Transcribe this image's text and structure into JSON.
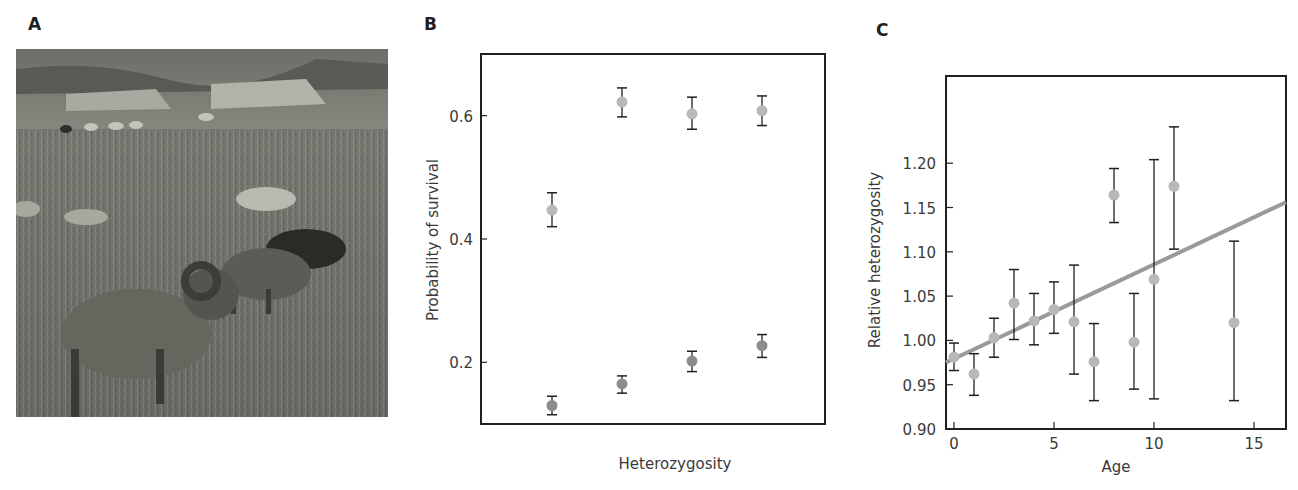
{
  "panels": {
    "a": {
      "label": "A",
      "image_description": "Grayscale photo of Soay sheep grazing on a grassy hillside with stone ruins in the background"
    },
    "b": {
      "label": "B"
    },
    "c": {
      "label": "C"
    }
  },
  "chart_data": [
    {
      "panel": "B",
      "type": "scatter",
      "title": "",
      "xlabel": "Heterozygosity",
      "ylabel": "Probability of survival",
      "ylim": [
        0.1,
        0.7
      ],
      "yticks": [
        0.2,
        0.4,
        0.6
      ],
      "ytick_labels": [
        "0.2",
        "0.4",
        "0.6"
      ],
      "xticks": [],
      "categories": [
        "1",
        "2",
        "3",
        "4"
      ],
      "grid": false,
      "legend": null,
      "series": [
        {
          "name": "upper (light gray)",
          "color": "#b8b8b8",
          "values": [
            0.447,
            0.622,
            0.603,
            0.608
          ],
          "err_low": [
            0.42,
            0.598,
            0.578,
            0.584
          ],
          "err_high": [
            0.475,
            0.645,
            0.63,
            0.632
          ]
        },
        {
          "name": "lower (dark gray)",
          "color": "#8c8c8c",
          "values": [
            0.13,
            0.165,
            0.202,
            0.227
          ],
          "err_low": [
            0.115,
            0.15,
            0.185,
            0.208
          ],
          "err_high": [
            0.145,
            0.178,
            0.218,
            0.245
          ]
        }
      ]
    },
    {
      "panel": "C",
      "type": "scatter",
      "title": "",
      "xlabel": "Age",
      "ylabel": "Relative heterozygosity",
      "xlim": [
        -0.4,
        16.6
      ],
      "ylim": [
        0.9,
        1.3
      ],
      "xticks": [
        0,
        5,
        10,
        15
      ],
      "xtick_labels": [
        "0",
        "5",
        "10",
        "15"
      ],
      "yticks": [
        0.9,
        0.95,
        1.0,
        1.05,
        1.1,
        1.15,
        1.2
      ],
      "ytick_labels": [
        "0.90",
        "0.95",
        "1.00",
        "1.05",
        "1.10",
        "1.15",
        "1.20"
      ],
      "grid": false,
      "legend": null,
      "series": [
        {
          "name": "Relative heterozygosity by age",
          "color": "#b8b8b8",
          "x": [
            0,
            1,
            2,
            3,
            4,
            5,
            6,
            7,
            8,
            9,
            10,
            11,
            14
          ],
          "values": [
            0.981,
            0.962,
            1.003,
            1.042,
            1.022,
            1.035,
            1.021,
            0.976,
            1.164,
            0.998,
            1.069,
            1.174,
            1.02
          ],
          "err_low": [
            0.966,
            0.938,
            0.981,
            1.001,
            0.995,
            1.008,
            0.962,
            0.932,
            1.133,
            0.945,
            0.934,
            1.103,
            0.932
          ],
          "err_high": [
            0.997,
            0.985,
            1.025,
            1.08,
            1.053,
            1.066,
            1.085,
            1.019,
            1.194,
            1.053,
            1.204,
            1.241,
            1.112
          ]
        }
      ],
      "trendline": {
        "color": "#9a9a9a",
        "x": [
          -0.4,
          16.6
        ],
        "y": [
          0.975,
          1.156
        ]
      }
    }
  ]
}
